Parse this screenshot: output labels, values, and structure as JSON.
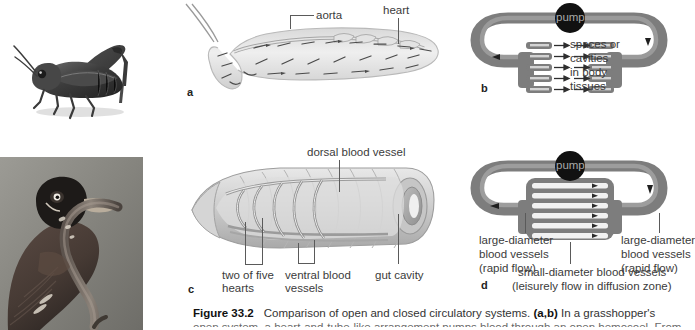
{
  "figure": {
    "number": "Figure 33.2",
    "title_text": "Comparison of open and closed circulatory systems.",
    "ref_ab": "(a,b)",
    "lead_text": "In a grasshopper's",
    "line2": "open system, a heart-and-tube-like arrangement pumps blood through an open hemocoel. From there,"
  },
  "panels": {
    "a": {
      "letter": "a",
      "labels": {
        "aorta": "aorta",
        "heart": "heart"
      },
      "photo_alt": "grasshopper"
    },
    "b": {
      "letter": "b",
      "labels": {
        "pump": "pump",
        "spaces_line1": "spaces or",
        "spaces_line2": "cavities",
        "spaces_line3": "in body",
        "spaces_line4": "tissues"
      }
    },
    "c": {
      "letter": "c",
      "labels": {
        "dorsal": "dorsal blood vessel",
        "hearts_line1": "two of five",
        "hearts_line2": "hearts",
        "ventral_line1": "ventral blood",
        "ventral_line2": "vessels",
        "gut": "gut cavity"
      },
      "photo_alt": "robin with earthworm"
    },
    "d": {
      "letter": "d",
      "labels": {
        "pump": "pump",
        "left_line1": "large-diameter",
        "left_line2": "blood vessels",
        "left_line3": "(rapid flow)",
        "right_line1": "large-diameter",
        "right_line2": "blood vessels",
        "right_line3": "(rapid flow)",
        "small_line1": "small-diameter blood vessels",
        "small_line2": "(leisurely flow in diffusion zone)"
      }
    }
  },
  "colors": {
    "tube_gray": "#7d7d7d",
    "tube_dark": "#5f5f5f",
    "pump_black": "#111111",
    "text_gray": "#3b3b3b",
    "leader_gray": "#5a5a5a",
    "photo_bg": "#8a8984"
  }
}
